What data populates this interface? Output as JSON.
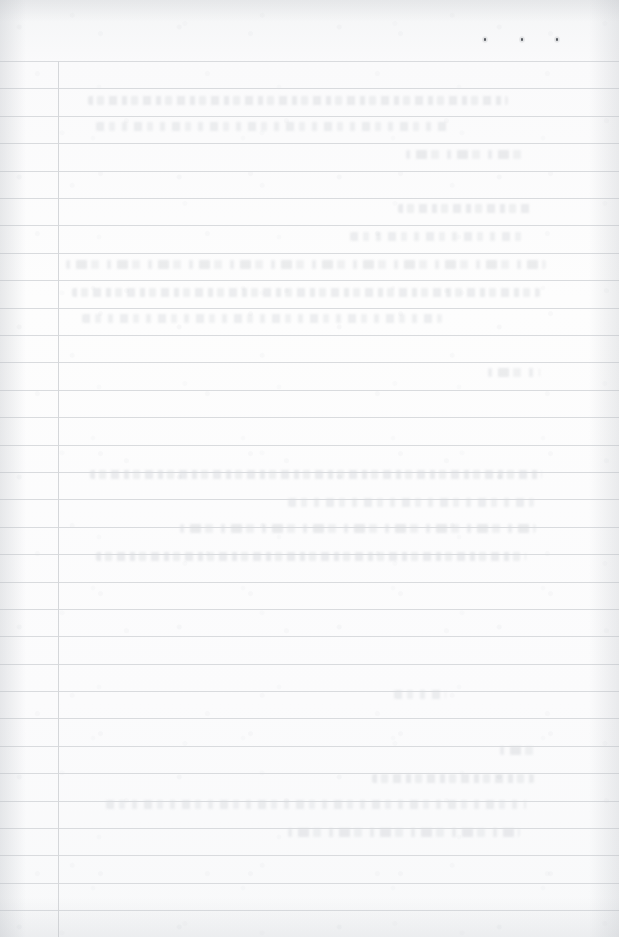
{
  "document": {
    "kind": "scanned-ruled-page",
    "title": "Blank ruled notebook page (scan)",
    "page_width": 619,
    "page_height": 937,
    "header_text": "",
    "body_text": "",
    "footer_text": "",
    "page_number": ""
  },
  "colors": {
    "paper": "#fcfcfc",
    "paper_tone_top": "#f4f5f6",
    "rule_line": "#d9dbde",
    "margin_line": "#d5d7da",
    "ink_dot": "#4a4d52",
    "ghost_text": "#babec4"
  },
  "ruling": {
    "orientation": "horizontal",
    "first_rule_y": 61,
    "line_spacing": 27.4,
    "line_count": 32,
    "rule_thickness": 1,
    "rule_left_x": 0,
    "rule_right_x": 619,
    "rule_y_positions": [
      61,
      88,
      116,
      143,
      171,
      198,
      225,
      253,
      280,
      308,
      335,
      362,
      390,
      417,
      445,
      472,
      499,
      527,
      554,
      582,
      609,
      636,
      664,
      691,
      718,
      746,
      773,
      801,
      828,
      855,
      883,
      910
    ],
    "margin_rule": {
      "name": "vertical-margin-rule",
      "x": 58,
      "top_y": 61,
      "bottom_y": 937,
      "thickness": 1
    }
  },
  "header_band": {
    "name": "header-band",
    "top_y": 0,
    "bottom_y": 61,
    "content": ""
  },
  "ink_marks": [
    {
      "name": "ink-dot-1",
      "x": 484,
      "y": 38
    },
    {
      "name": "ink-dot-2",
      "x": 521,
      "y": 38
    },
    {
      "name": "ink-dot-3",
      "x": 556,
      "y": 38
    }
  ],
  "bleed_through": {
    "description": "faint illegible show-through of writing from the reverse side of the sheet",
    "legible": false,
    "bands": [
      {
        "x": 88,
        "y": 96,
        "width": 420,
        "variant": "g1"
      },
      {
        "x": 96,
        "y": 122,
        "width": 352,
        "variant": "g2"
      },
      {
        "x": 406,
        "y": 150,
        "width": 122,
        "variant": "g3"
      },
      {
        "x": 398,
        "y": 204,
        "width": 134,
        "variant": "g1"
      },
      {
        "x": 350,
        "y": 232,
        "width": 178,
        "variant": "g2"
      },
      {
        "x": 66,
        "y": 260,
        "width": 480,
        "variant": "g3"
      },
      {
        "x": 72,
        "y": 288,
        "width": 468,
        "variant": "g1"
      },
      {
        "x": 82,
        "y": 314,
        "width": 360,
        "variant": "g2"
      },
      {
        "x": 488,
        "y": 368,
        "width": 52,
        "variant": "g3"
      },
      {
        "x": 90,
        "y": 470,
        "width": 452,
        "variant": "g1"
      },
      {
        "x": 288,
        "y": 498,
        "width": 246,
        "variant": "g2"
      },
      {
        "x": 180,
        "y": 524,
        "width": 356,
        "variant": "g3"
      },
      {
        "x": 96,
        "y": 552,
        "width": 430,
        "variant": "g1"
      },
      {
        "x": 394,
        "y": 690,
        "width": 52,
        "variant": "g2"
      },
      {
        "x": 500,
        "y": 746,
        "width": 40,
        "variant": "g3"
      },
      {
        "x": 372,
        "y": 774,
        "width": 162,
        "variant": "g1"
      },
      {
        "x": 106,
        "y": 800,
        "width": 420,
        "variant": "g2"
      },
      {
        "x": 288,
        "y": 828,
        "width": 232,
        "variant": "g3"
      }
    ]
  }
}
